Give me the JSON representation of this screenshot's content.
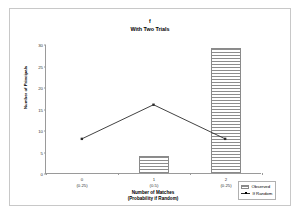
{
  "chart_data": {
    "type": "bar",
    "title": "f",
    "subtitle": "With Two Trials",
    "xlabel": "Number of Matches",
    "xlabel2": "(Probability if Random)",
    "ylabel": "Number of Principals",
    "categories": [
      "0",
      "1",
      "2"
    ],
    "category_sublabels": [
      "(0.25)",
      "(0.5)",
      "(0.25)"
    ],
    "ylim": [
      0,
      30
    ],
    "yticks": [
      0,
      5,
      10,
      15,
      20,
      25,
      30
    ],
    "grid": false,
    "legend_position": "bottom-right",
    "series": [
      {
        "name": "Observed",
        "type": "bar",
        "values": [
          0,
          4,
          29
        ]
      },
      {
        "name": "If Random",
        "type": "line",
        "values": [
          8,
          16,
          8
        ]
      }
    ]
  },
  "legend": {
    "items": [
      {
        "label": "Observed",
        "swatch": "hatched-bar-swatch"
      },
      {
        "label": "If Random",
        "swatch": "line-marker-swatch"
      }
    ]
  },
  "colors": {
    "bar_fill": "#ffffff",
    "bar_hatch": "#8d8d8d",
    "bar_border": "#8a8a8a",
    "line": "#2b2b2b",
    "axis": "#9a9a9a",
    "frame": "#c8c8c8",
    "text": "#000000"
  }
}
